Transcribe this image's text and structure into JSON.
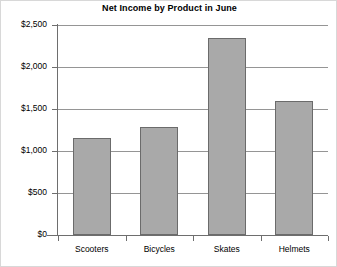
{
  "chart_data": {
    "type": "bar",
    "title": "Net Income by Product in June",
    "xlabel": "",
    "ylabel": "",
    "categories": [
      "Scooters",
      "Bicycles",
      "Skates",
      "Helmets"
    ],
    "values": [
      1150,
      1280,
      2350,
      1600
    ],
    "ylim": [
      0,
      2500
    ],
    "ytick_values": [
      0,
      500,
      1000,
      1500,
      2000,
      2500
    ],
    "ytick_labels": [
      "$0",
      "$500",
      "$1,000",
      "$1,500",
      "$2,000",
      "$2,500"
    ],
    "grid": true,
    "legend": false,
    "bar_color": "#a9a9a9",
    "bar_border_color": "#6b6b6b",
    "axis_color": "#6e6e6e",
    "gridline_color": "#959595",
    "background_color": "#ffffff",
    "series": [
      {
        "name": "Net Income",
        "values": [
          1150,
          1280,
          2350,
          1600
        ]
      }
    ]
  }
}
